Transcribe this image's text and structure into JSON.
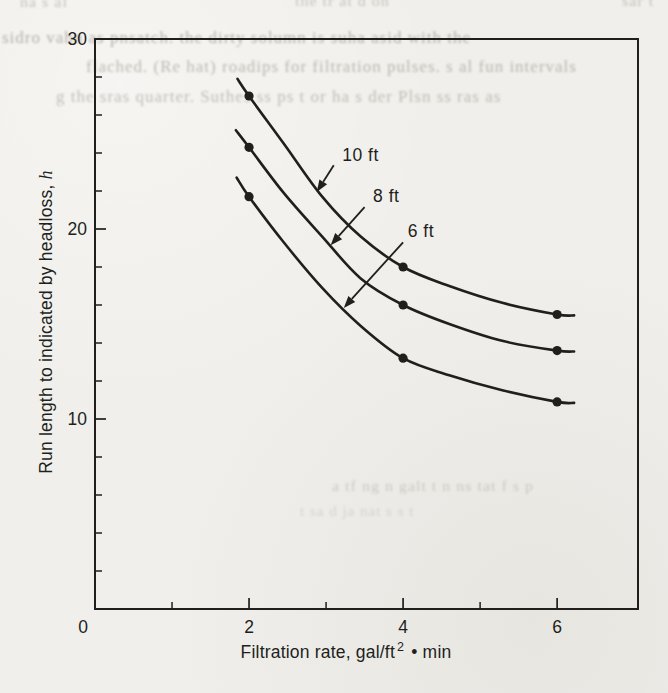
{
  "page": {
    "background": "#f1efeb",
    "ink": "#211f1c"
  },
  "bleedthrough": {
    "lines": [
      {
        "x": 20,
        "y": -7,
        "text": "na s al",
        "size": 16,
        "opacity": 0.45
      },
      {
        "x": 295,
        "y": -8,
        "text": "the tr at d on",
        "size": 16,
        "opacity": 0.45
      },
      {
        "x": 622,
        "y": -8,
        "text": "sar t",
        "size": 16,
        "opacity": 0.45
      },
      {
        "x": 2,
        "y": 28,
        "text": "sidro vahn as pnsatch. the dirty solumn is suha asid with the",
        "size": 17,
        "opacity": 0.62
      },
      {
        "x": 86,
        "y": 57,
        "text": "flached. (Re hat) roadips for filtration pulses. s al fun intervals",
        "size": 17,
        "opacity": 0.55
      },
      {
        "x": 56,
        "y": 87,
        "text": "g the sras quarter. Suthes ss   ps t or   ha s der  Plsn ss ras  as",
        "size": 17,
        "opacity": 0.5
      },
      {
        "x": 332,
        "y": 477,
        "text": "a tf  ng   n galt   t  n   ns    tat f  s  p",
        "size": 16,
        "opacity": 0.35
      },
      {
        "x": 300,
        "y": 503,
        "text": "t    sa    d  ja   nat    s   s    t",
        "size": 15,
        "opacity": 0.25
      }
    ]
  },
  "chart_data": {
    "type": "line",
    "title": "",
    "xlabel": "Filtration rate, gal/ft² • min",
    "xlabel_parts": {
      "prefix": "Filtration rate, gal/ft",
      "sup": "2",
      "suffix": " • min"
    },
    "ylabel": "Run length to indicated by headloss, h",
    "ylabel_parts": {
      "prefix": "Run length to indicated by headloss, ",
      "italic_var": "h"
    },
    "x_range": [
      0,
      7.05
    ],
    "y_range": [
      0,
      30
    ],
    "x_major_ticks": [
      0,
      2,
      4,
      6
    ],
    "x_minor_ticks": [
      1,
      3,
      5
    ],
    "y_major_ticks": [
      10,
      20,
      30
    ],
    "y_minor_ticks": [
      2,
      4,
      6,
      8,
      12,
      14,
      16,
      18,
      22,
      24,
      26,
      28
    ],
    "grid": "off",
    "legend": "inline-arrow-labels",
    "marker_x": [
      2,
      4,
      6
    ],
    "series": [
      {
        "name": "10 ft",
        "points": [
          [
            2,
            27
          ],
          [
            4,
            18
          ],
          [
            6,
            15.5
          ]
        ],
        "curve": [
          [
            1.85,
            27.9
          ],
          [
            2,
            27
          ],
          [
            2.45,
            24.5
          ],
          [
            2.95,
            21.7
          ],
          [
            3.45,
            19.6
          ],
          [
            4,
            18
          ],
          [
            4.6,
            17
          ],
          [
            5.3,
            16.1
          ],
          [
            6,
            15.5
          ],
          [
            6.22,
            15.45
          ]
        ]
      },
      {
        "name": "8 ft",
        "points": [
          [
            2,
            24.3
          ],
          [
            4,
            16
          ],
          [
            6,
            13.6
          ]
        ],
        "curve": [
          [
            1.83,
            25.2
          ],
          [
            2,
            24.3
          ],
          [
            2.45,
            21.9
          ],
          [
            2.95,
            19.6
          ],
          [
            3.45,
            17.4
          ],
          [
            4,
            16
          ],
          [
            4.6,
            15
          ],
          [
            5.3,
            14.1
          ],
          [
            6,
            13.6
          ],
          [
            6.22,
            13.55
          ]
        ]
      },
      {
        "name": "6 ft",
        "points": [
          [
            2,
            21.7
          ],
          [
            4,
            13.2
          ],
          [
            6,
            10.9
          ]
        ],
        "curve": [
          [
            1.84,
            22.7
          ],
          [
            2,
            21.7
          ],
          [
            2.45,
            19.3
          ],
          [
            2.95,
            16.9
          ],
          [
            3.45,
            14.9
          ],
          [
            4,
            13.2
          ],
          [
            4.6,
            12.3
          ],
          [
            5.3,
            11.5
          ],
          [
            6,
            10.9
          ],
          [
            6.22,
            10.85
          ]
        ]
      }
    ],
    "annotations": [
      {
        "label": "10 ft",
        "text_at": [
          3.21,
          23.6
        ],
        "arrow_from": [
          3.1,
          23.35
        ],
        "arrow_to": [
          2.88,
          21.95
        ]
      },
      {
        "label": "8 ft",
        "text_at": [
          3.61,
          21.4
        ],
        "arrow_from": [
          3.5,
          21.15
        ],
        "arrow_to": [
          3.06,
          19.15
        ]
      },
      {
        "label": "6 ft",
        "text_at": [
          4.06,
          19.6
        ],
        "arrow_from": [
          4.0,
          19.3
        ],
        "arrow_to": [
          3.23,
          15.85
        ]
      }
    ],
    "plot_box_px": {
      "left": 95,
      "top": 39,
      "right": 638,
      "bottom": 609
    },
    "style": {
      "curve_width": 2.6,
      "axis_width": 2,
      "marker_radius": 4.6
    }
  }
}
